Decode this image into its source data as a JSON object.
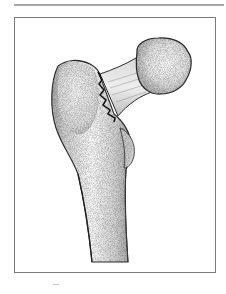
{
  "illustration": {
    "subject": "proximal femur with intertrochanteric fracture",
    "style": "stippled pencil drawing",
    "parts": [
      "femoral-head",
      "femoral-neck",
      "greater-trochanter",
      "lesser-trochanter",
      "shaft",
      "fracture-line"
    ]
  },
  "colors": {
    "frame_border": "#7a7a7a",
    "top_rule": "#a8a8a8",
    "bone_fill": "#ececec",
    "bone_shadow": "#b9b9b9",
    "outline": "#2a2a2a",
    "fracture": "#111111"
  }
}
